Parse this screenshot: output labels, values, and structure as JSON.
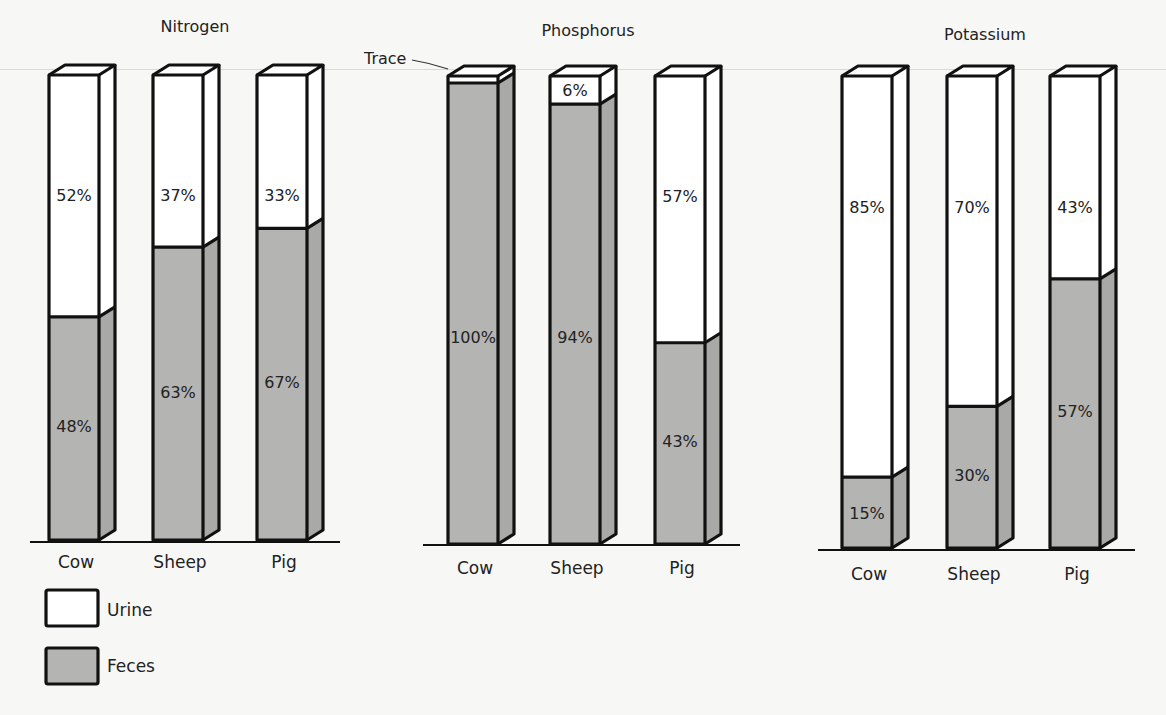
{
  "chart_data": {
    "type": "bar",
    "subtype": "stacked-3d-percent",
    "legend": [
      {
        "name": "Urine",
        "color": "#ffffff"
      },
      {
        "name": "Feces",
        "color": "#b4b4b2"
      }
    ],
    "legend_position": "bottom-left",
    "grid": false,
    "ylim": [
      0,
      100
    ],
    "annotations": [
      {
        "text": "Trace",
        "target": "Phosphorus / Cow / Urine"
      }
    ],
    "panels": [
      {
        "title": "Nitrogen",
        "categories": [
          "Cow",
          "Sheep",
          "Pig"
        ],
        "series": [
          {
            "name": "Feces",
            "values": [
              48,
              63,
              67
            ]
          },
          {
            "name": "Urine",
            "values": [
              52,
              37,
              33
            ]
          }
        ]
      },
      {
        "title": "Phosphorus",
        "categories": [
          "Cow",
          "Sheep",
          "Pig"
        ],
        "series": [
          {
            "name": "Feces",
            "values": [
              100,
              94,
              43
            ]
          },
          {
            "name": "Urine",
            "values": [
              0,
              6,
              57
            ]
          }
        ],
        "value_labels": {
          "Feces": [
            "100%",
            "94%",
            "43%"
          ],
          "Urine": [
            "Trace",
            "6%",
            "57%"
          ]
        }
      },
      {
        "title": "Potassium",
        "categories": [
          "Cow",
          "Sheep",
          "Pig"
        ],
        "series": [
          {
            "name": "Feces",
            "values": [
              15,
              30,
              57
            ]
          },
          {
            "name": "Urine",
            "values": [
              85,
              70,
              43
            ]
          }
        ]
      }
    ]
  },
  "colors": {
    "urine": "#ffffff",
    "feces": "#b4b4b2",
    "feces_side": "#a9a9a7",
    "outline": "#111111",
    "background": "#f7f7f5"
  },
  "legend": {
    "urine_label": "Urine",
    "feces_label": "Feces"
  },
  "titles": [
    "Nitrogen",
    "Phosphorus",
    "Potassium"
  ],
  "trace_label": "Trace"
}
